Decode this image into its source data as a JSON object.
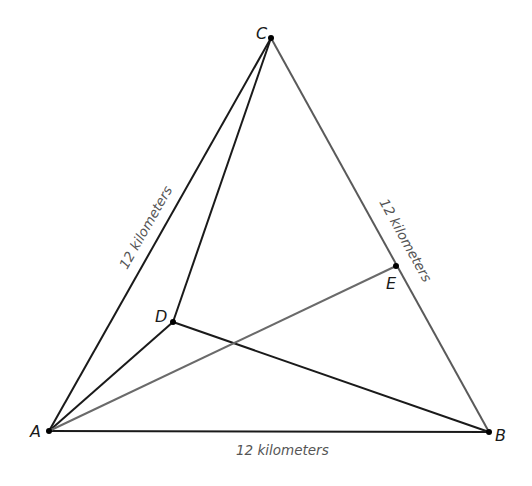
{
  "diagram": {
    "title": "",
    "points": {
      "A": {
        "label": "A",
        "x": 49,
        "y": 431
      },
      "B": {
        "label": "B",
        "x": 489,
        "y": 432
      },
      "C": {
        "label": "C",
        "x": 271,
        "y": 38
      },
      "D": {
        "label": "D",
        "x": 173,
        "y": 322
      },
      "E": {
        "label": "E",
        "x": 396,
        "y": 266
      }
    },
    "segments": [
      {
        "from": "A",
        "to": "B",
        "color": "#1a1a1a"
      },
      {
        "from": "A",
        "to": "C",
        "color": "#1a1a1a"
      },
      {
        "from": "C",
        "to": "B",
        "color": "#555555"
      },
      {
        "from": "A",
        "to": "D",
        "color": "#1a1a1a"
      },
      {
        "from": "D",
        "to": "C",
        "color": "#1a1a1a"
      },
      {
        "from": "D",
        "to": "B",
        "color": "#1a1a1a"
      },
      {
        "from": "A",
        "to": "E",
        "color": "#6a6a6a"
      }
    ],
    "side_labels": {
      "AC": "12 kilometers",
      "CB": "12 kilometers",
      "AB": "12 kilometers"
    },
    "colors": {
      "line_dark": "#1a1a1a",
      "line_gray": "#5a5a5a",
      "label_text": "#1a1a1a",
      "measure_text": "#555555"
    }
  }
}
